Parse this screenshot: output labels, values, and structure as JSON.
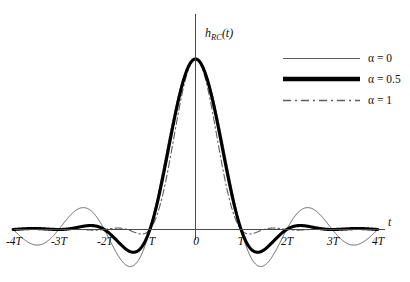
{
  "figure": {
    "background_color": "#ffffff",
    "ylabel": {
      "base": "h",
      "subscript": "RC",
      "argument": "(t)",
      "full": "h_RC(t)"
    },
    "xaxis_name": "t",
    "x_tick_labels": [
      "-4T",
      "-3T",
      "-2T",
      "T",
      "0",
      "T",
      "2T",
      "3T",
      "4T"
    ],
    "legend": [
      {
        "label": "α = 0",
        "style": "solid-thin",
        "color": "#5a5a5a"
      },
      {
        "label": "α = 0.5",
        "style": "solid-thick",
        "color": "#000000"
      },
      {
        "label": "α = 1",
        "style": "dash-dot",
        "color": "#5f5f5f"
      }
    ]
  },
  "chart_data": {
    "type": "line",
    "title": "",
    "subtitle": "",
    "xlabel": "t",
    "ylabel": "h_RC(t)",
    "grid": false,
    "legend_position": "top-right",
    "xlim": [
      -4,
      4
    ],
    "ylim": [
      -0.25,
      1.05
    ],
    "x_tick_values": [
      -4,
      -3,
      -2,
      -1,
      0,
      1,
      2,
      3,
      4
    ],
    "x_tick_labels": [
      "-4T",
      "-3T",
      "-2T",
      "T",
      "0",
      "T",
      "2T",
      "3T",
      "4T"
    ],
    "x_unit": "T",
    "y_axis_visible_ticks": [],
    "formula": "h_RC(t) = sinc(t/T) * cos(pi*alpha*t/T) / (1 - (2*alpha*t/T)^2)",
    "series": [
      {
        "name": "α = 0",
        "alpha": 0,
        "style": "solid-thin",
        "color": "#5a5a5a",
        "x": [
          -4,
          -3.5,
          -3,
          -2.5,
          -2,
          -1.5,
          -1,
          -0.5,
          0,
          0.5,
          1,
          1.5,
          2,
          2.5,
          3,
          3.5,
          4
        ],
        "values": [
          0,
          0.0909,
          0,
          -0.1273,
          0,
          0.2122,
          0,
          0.6366,
          1,
          0.6366,
          0,
          -0.2122,
          0,
          0.1273,
          0,
          -0.0909,
          0
        ]
      },
      {
        "name": "α = 0.5",
        "alpha": 0.5,
        "style": "solid-thick",
        "color": "#000000",
        "x": [
          -4,
          -3.5,
          -3,
          -2.5,
          -2,
          -1.5,
          -1,
          -0.5,
          0,
          0.5,
          1,
          1.5,
          2,
          2.5,
          3,
          3.5,
          4
        ],
        "values": [
          0,
          0.0129,
          0,
          -0.0212,
          0,
          0.0707,
          0,
          0.6002,
          1,
          0.6002,
          0,
          -0.0707,
          0,
          0.0212,
          0,
          -0.0129,
          0
        ]
      },
      {
        "name": "α = 1",
        "alpha": 1,
        "style": "dash-dot",
        "color": "#5f5f5f",
        "x": [
          -4,
          -3.5,
          -3,
          -2.5,
          -2,
          -1.5,
          -1,
          -0.5,
          0,
          0.5,
          1,
          1.5,
          2,
          2.5,
          3,
          3.5,
          4
        ],
        "values": [
          0,
          0.0033,
          0,
          -0.0061,
          0,
          0.0212,
          0,
          0.5,
          1,
          0.5,
          0,
          -0.0212,
          0,
          0.0061,
          0,
          -0.0033,
          0
        ]
      }
    ]
  }
}
